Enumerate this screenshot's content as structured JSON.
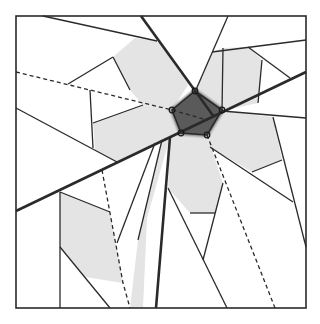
{
  "diagram": {
    "title": "",
    "colors": {
      "background": "#ffffff",
      "stroke": "#2a2a2a",
      "light_fill": "#e4e4e4",
      "dark_fill": "#5a5a5a",
      "dark_halo": "#7a7a7a"
    },
    "frame": {
      "x": 16,
      "y": 16,
      "width": 290,
      "height": 292
    },
    "center_pentagon": {
      "points": [
        [
          195,
          91
        ],
        [
          222,
          110
        ],
        [
          207,
          135
        ],
        [
          181,
          133
        ],
        [
          172,
          110
        ]
      ],
      "vertex_markers": [
        [
          195,
          91
        ],
        [
          222,
          110
        ],
        [
          207,
          135
        ],
        [
          181,
          133
        ],
        [
          172,
          110
        ]
      ]
    },
    "light_polygons": [
      {
        "name": "petal-upper-left",
        "points": [
          [
            113,
            57
          ],
          [
            135,
            38
          ],
          [
            157,
            41
          ],
          [
            190,
            82
          ],
          [
            172,
            110
          ],
          [
            143,
            105
          ],
          [
            130,
            90
          ]
        ]
      },
      {
        "name": "petal-left",
        "points": [
          [
            93,
            123
          ],
          [
            143,
            105
          ],
          [
            172,
            110
          ],
          [
            181,
            133
          ],
          [
            117,
            162
          ],
          [
            95,
            150
          ]
        ]
      },
      {
        "name": "petal-upper-right",
        "points": [
          [
            212,
            52
          ],
          [
            223,
            48
          ],
          [
            248,
            47
          ],
          [
            262,
            60
          ],
          [
            258,
            103
          ],
          [
            222,
            111
          ],
          [
            195,
            92
          ]
        ]
      },
      {
        "name": "petal-right",
        "points": [
          [
            222,
            111
          ],
          [
            273,
            117
          ],
          [
            282,
            160
          ],
          [
            252,
            172
          ],
          [
            210,
            147
          ],
          [
            207,
            135
          ]
        ]
      },
      {
        "name": "petal-lower",
        "points": [
          [
            181,
            133
          ],
          [
            207,
            135
          ],
          [
            223,
            183
          ],
          [
            215,
            213
          ],
          [
            190,
            213
          ],
          [
            168,
            188
          ],
          [
            170,
            137
          ]
        ]
      },
      {
        "name": "strip-lower",
        "points": [
          [
            170,
            137
          ],
          [
            162,
            140
          ],
          [
            138,
            240
          ],
          [
            130,
            308
          ],
          [
            143,
            308
          ],
          [
            147,
            218
          ]
        ]
      },
      {
        "name": "petal-lower-left",
        "points": [
          [
            60,
            192
          ],
          [
            110,
            212
          ],
          [
            123,
            283
          ],
          [
            85,
            277
          ],
          [
            60,
            247
          ]
        ]
      }
    ],
    "bold_lines": [
      {
        "name": "bold-line-diagonal-down",
        "from": [
          141,
          16
        ],
        "to": [
          214,
          117
        ]
      },
      {
        "name": "bold-line-long-ascending",
        "from": [
          16,
          211
        ],
        "to": [
          306,
          72
        ]
      },
      {
        "name": "bold-line-near-vertical",
        "from": [
          170,
          137
        ],
        "to": [
          156,
          308
        ]
      }
    ],
    "dashed_lines": [
      {
        "name": "dashed-line-left",
        "points": [
          [
            16,
            72
          ],
          [
            172,
            110
          ],
          [
            207,
            120
          ]
        ]
      },
      {
        "name": "dashed-line-lower-right",
        "points": [
          [
            207,
            135
          ],
          [
            275,
            308
          ]
        ]
      },
      {
        "name": "dashed-line-lower-left",
        "points": [
          [
            102,
            170
          ],
          [
            123,
            283
          ],
          [
            130,
            308
          ]
        ]
      }
    ],
    "thin_lines": [
      {
        "from": [
          43,
          16
        ],
        "to": [
          157,
          41
        ]
      },
      {
        "from": [
          68,
          84
        ],
        "to": [
          113,
          57
        ]
      },
      {
        "from": [
          113,
          57
        ],
        "to": [
          130,
          90
        ]
      },
      {
        "from": [
          90,
          90
        ],
        "to": [
          93,
          148
        ]
      },
      {
        "from": [
          93,
          123
        ],
        "to": [
          143,
          105
        ]
      },
      {
        "from": [
          16,
          108
        ],
        "to": [
          117,
          162
        ]
      },
      {
        "from": [
          228,
          16
        ],
        "to": [
          195,
          92
        ]
      },
      {
        "from": [
          212,
          52
        ],
        "to": [
          306,
          40
        ]
      },
      {
        "from": [
          223,
          48
        ],
        "to": [
          222,
          111
        ]
      },
      {
        "from": [
          248,
          47
        ],
        "to": [
          290,
          78
        ]
      },
      {
        "from": [
          262,
          60
        ],
        "to": [
          258,
          103
        ]
      },
      {
        "from": [
          222,
          111
        ],
        "to": [
          306,
          118
        ]
      },
      {
        "from": [
          273,
          117
        ],
        "to": [
          306,
          247
        ]
      },
      {
        "from": [
          210,
          147
        ],
        "to": [
          293,
          202
        ]
      },
      {
        "from": [
          252,
          172
        ],
        "to": [
          282,
          160
        ]
      },
      {
        "from": [
          168,
          188
        ],
        "to": [
          227,
          308
        ]
      },
      {
        "from": [
          223,
          183
        ],
        "to": [
          203,
          260
        ]
      },
      {
        "from": [
          190,
          213
        ],
        "to": [
          215,
          213
        ]
      },
      {
        "from": [
          60,
          192
        ],
        "to": [
          60,
          308
        ]
      },
      {
        "from": [
          60,
          247
        ],
        "to": [
          110,
          308
        ]
      },
      {
        "from": [
          117,
          243
        ],
        "to": [
          155,
          143
        ]
      },
      {
        "from": [
          60,
          192
        ],
        "to": [
          110,
          212
        ]
      },
      {
        "from": [
          138,
          240
        ],
        "to": [
          162,
          140
        ]
      }
    ]
  }
}
